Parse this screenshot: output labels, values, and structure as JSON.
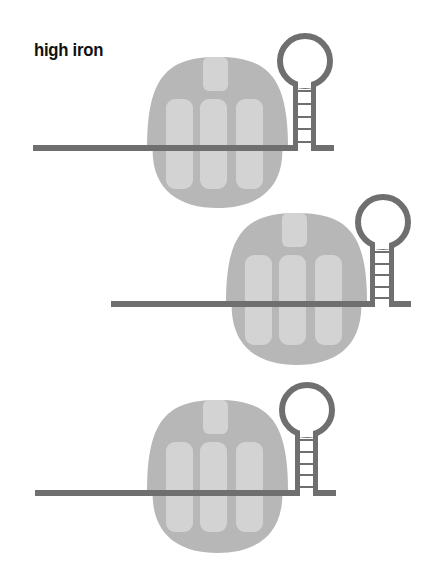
{
  "title": "high iron",
  "colors": {
    "background": "#ffffff",
    "ribosome_outer": "#b7b7b7",
    "ribosome_inner": "#d3d3d3",
    "mrna": "#6f6f6f",
    "title": "#111111"
  },
  "panels": [
    {
      "name": "panel-1",
      "ribosome": {
        "left": 147,
        "top": 57,
        "width": 141,
        "height": 151,
        "split_y": 148
      },
      "mrna": {
        "x_start": 33,
        "y": 145,
        "thickness": 6
      },
      "hairpin": {
        "cx": 305,
        "cy": 61,
        "r": 25,
        "stem_left": 293,
        "stem_right": 311,
        "tail_end": 334,
        "rungs": 5
      }
    },
    {
      "name": "panel-2",
      "ribosome": {
        "left": 226,
        "top": 213,
        "width": 141,
        "height": 152,
        "split_y": 302
      },
      "mrna": {
        "x_start": 111,
        "y": 301,
        "thickness": 6
      },
      "hairpin": {
        "cx": 383,
        "cy": 222,
        "r": 25,
        "stem_left": 370,
        "stem_right": 389,
        "tail_end": 411,
        "rungs": 5
      }
    },
    {
      "name": "panel-3",
      "ribosome": {
        "left": 147,
        "top": 400,
        "width": 141,
        "height": 153,
        "split_y": 491
      },
      "mrna": {
        "x_start": 35,
        "y": 490,
        "thickness": 6
      },
      "hairpin": {
        "cx": 307,
        "cy": 410,
        "r": 25,
        "stem_left": 295,
        "stem_right": 313,
        "tail_end": 336,
        "rungs": 5
      }
    }
  ]
}
